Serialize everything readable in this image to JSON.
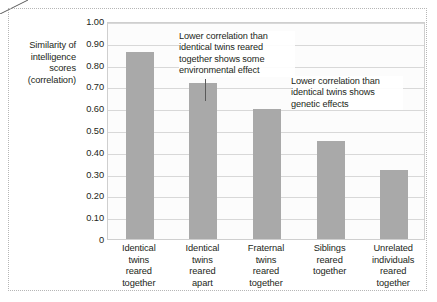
{
  "chart_data": {
    "type": "bar",
    "title": "",
    "xlabel": "",
    "ylabel": "Similarity of intelligence scores (correlation)",
    "ylim": [
      0,
      1.0
    ],
    "grid": true,
    "legend": "none",
    "categories": [
      "Identical twins reared together",
      "Identical twins reared apart",
      "Fraternal twins reared together",
      "Siblings reared together",
      "Unrelated individuals reared together"
    ],
    "values": [
      0.86,
      0.715,
      0.595,
      0.45,
      0.315
    ],
    "ytick_labels": [
      "1.00",
      "0.90",
      "0.80",
      "0.70",
      "0.60",
      "0.50",
      "0.40",
      "0.30",
      "0.20",
      "0.10",
      "0"
    ],
    "ytick_values": [
      1.0,
      0.9,
      0.8,
      0.7,
      0.6,
      0.5,
      0.4,
      0.3,
      0.2,
      0.1,
      0
    ],
    "bar_color": "#a9a9a9",
    "annotations": [
      "Lower correlation than identical twins reared together shows some environmental effect",
      "Lower correlation than identical twins shows genetic effects"
    ]
  },
  "axis": {
    "y_title_lines": [
      "Similarity of",
      "intelligence",
      "scores",
      "(correlation)"
    ]
  },
  "x_labels": [
    [
      "Identical",
      "twins",
      "reared",
      "together"
    ],
    [
      "Identical",
      "twins",
      "reared",
      "apart"
    ],
    [
      "Fraternal",
      "twins",
      "reared",
      "together"
    ],
    [
      "Siblings",
      "reared",
      "together"
    ],
    [
      "Unrelated",
      "individuals",
      "reared",
      "together"
    ]
  ],
  "annotations": {
    "first": {
      "lines": [
        "Lower correlation than",
        "identical twins reared",
        "together shows some",
        "environmental effect"
      ]
    },
    "second": {
      "lines": [
        "Lower correlation than",
        "identical twins shows",
        "genetic effects"
      ]
    }
  }
}
